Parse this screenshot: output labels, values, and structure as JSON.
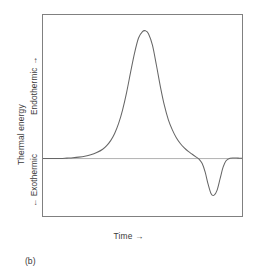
{
  "figure": {
    "caption": "(b)"
  },
  "axes": {
    "x_label": "Time →",
    "y_label_outer": "Thermal energy",
    "y_label_upper": "Endothermic →",
    "y_label_lower": "← Exothermic"
  },
  "colors": {
    "curve": "#666666",
    "baseline": "#b0b0b0",
    "frame": "#808080",
    "background": "#ffffff",
    "text": "#3a3a3a"
  },
  "chart_data": {
    "type": "line",
    "title": "",
    "subtitle": "",
    "xlabel": "Time →",
    "ylabel": "Thermal energy",
    "grid": false,
    "legend": "none",
    "axis_ticks": "none",
    "xlim": [
      0,
      100
    ],
    "ylim": [
      -40,
      100
    ],
    "baseline_y": 0,
    "annotations": [
      {
        "text": "Endothermic →",
        "axis": "y",
        "region": "upper"
      },
      {
        "text": "← Exothermic",
        "axis": "y",
        "region": "lower"
      },
      {
        "text": "(b)",
        "position": "below-left"
      }
    ],
    "features": [
      {
        "name": "endothermic-peak",
        "direction": "up",
        "x_apex": 51.5,
        "y_apex": 89,
        "onset_x": 30,
        "offset_x": 74
      },
      {
        "name": "exothermic-dip",
        "direction": "down",
        "x_apex": 84.5,
        "y_apex": -25,
        "onset_x": 76,
        "offset_x": 93
      }
    ],
    "series": [
      {
        "name": "DTA signal",
        "x": [
          0,
          3,
          6,
          9,
          12,
          15,
          18,
          21,
          24,
          27,
          30,
          32,
          34,
          36,
          38,
          40,
          42,
          44,
          46,
          48,
          50,
          51.5,
          53,
          55,
          57,
          59,
          61,
          63,
          65,
          67,
          69,
          71,
          73,
          75,
          77,
          78.5,
          80,
          81.5,
          83,
          84.5,
          86,
          87.5,
          89,
          90.5,
          92,
          94,
          96,
          98,
          100
        ],
        "y": [
          0,
          0,
          0,
          0,
          0.3,
          0.6,
          1.0,
          1.6,
          2.6,
          4.2,
          6.5,
          9.0,
          12.5,
          17.5,
          24.5,
          34.0,
          46.0,
          60.0,
          73.5,
          84.0,
          88.5,
          89.0,
          87.0,
          79.0,
          65.0,
          50.0,
          37.0,
          27.0,
          20.0,
          14.5,
          10.5,
          7.5,
          5.0,
          3.0,
          1.0,
          -0.5,
          -3.5,
          -9.5,
          -18.0,
          -24.5,
          -25.5,
          -22.0,
          -14.0,
          -6.0,
          -1.5,
          0.2,
          0.4,
          0.3,
          0.2
        ]
      }
    ]
  }
}
